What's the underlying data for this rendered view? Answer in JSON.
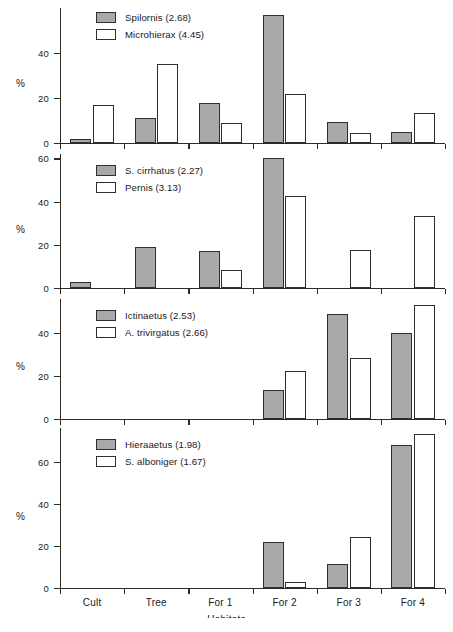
{
  "figure": {
    "xaxis_title": "Habitats",
    "yaxis_label": "%",
    "categories": [
      "Cult",
      "Tree",
      "For 1",
      "For 2",
      "For 3",
      "For 4"
    ],
    "fill_color": "#a9a9a9",
    "open_color": "#ffffff",
    "line_color": "#2e2e2e"
  },
  "chart_data": [
    {
      "type": "bar",
      "panel": 1,
      "title": "",
      "xlabel": "Habitats",
      "ylabel": "%",
      "categories": [
        "Cult",
        "Tree",
        "For 1",
        "For 2",
        "For 3",
        "For 4"
      ],
      "ylim": [
        0,
        60
      ],
      "yticks": [
        0,
        20,
        40
      ],
      "ytick_labels": [
        "0",
        "20",
        "40"
      ],
      "grid": false,
      "legend_position": "top-left",
      "series": [
        {
          "name": "Spilornis (2.68)",
          "style": "filled",
          "values": [
            2,
            11,
            18,
            57,
            9.5,
            5
          ]
        },
        {
          "name": "Microhierax (4.45)",
          "style": "open",
          "values": [
            17,
            35,
            9,
            22,
            4.5,
            13.5
          ]
        }
      ]
    },
    {
      "type": "bar",
      "panel": 2,
      "title": "",
      "xlabel": "Habitats",
      "ylabel": "%",
      "categories": [
        "Cult",
        "Tree",
        "For 1",
        "For 2",
        "For 3",
        "For 4"
      ],
      "ylim": [
        0,
        62
      ],
      "yticks": [
        0,
        20,
        40,
        60
      ],
      "ytick_labels": [
        "0",
        "20",
        "40",
        "60"
      ],
      "grid": false,
      "legend_position": "top-left",
      "series": [
        {
          "name": "S. cirrhatus (2.27)",
          "style": "filled",
          "values": [
            3,
            19,
            17,
            60,
            0,
            0
          ]
        },
        {
          "name": "Pernis (3.13)",
          "style": "open",
          "values": [
            0,
            0,
            8.5,
            42.5,
            17.5,
            33.5
          ]
        }
      ]
    },
    {
      "type": "bar",
      "panel": 3,
      "title": "",
      "xlabel": "Habitats",
      "ylabel": "%",
      "categories": [
        "Cult",
        "Tree",
        "For 1",
        "For 2",
        "For 3",
        "For 4"
      ],
      "ylim": [
        0,
        56
      ],
      "yticks": [
        0,
        20,
        40
      ],
      "ytick_labels": [
        "0",
        "20",
        "40"
      ],
      "grid": false,
      "legend_position": "top-left",
      "series": [
        {
          "name": "Ictinaetus (2.53)",
          "style": "filled",
          "values": [
            0,
            0,
            0,
            13.5,
            49,
            40
          ]
        },
        {
          "name": "A. trivirgatus (2.66)",
          "style": "open",
          "values": [
            0,
            0,
            0,
            22.5,
            28.5,
            53
          ]
        }
      ]
    },
    {
      "type": "bar",
      "panel": 4,
      "title": "",
      "xlabel": "Habitats",
      "ylabel": "%",
      "categories": [
        "Cult",
        "Tree",
        "For 1",
        "For 2",
        "For 3",
        "For 4"
      ],
      "ylim": [
        0,
        76
      ],
      "yticks": [
        0,
        20,
        40,
        60
      ],
      "ytick_labels": [
        "0",
        "20",
        "40",
        "60"
      ],
      "grid": false,
      "legend_position": "top-left",
      "series": [
        {
          "name": "Hieraaetus (1.98)",
          "style": "filled",
          "values": [
            0,
            0,
            0,
            22,
            11.5,
            68
          ]
        },
        {
          "name": "S. alboniger (1.67)",
          "style": "open",
          "values": [
            0,
            0,
            0,
            3,
            24,
            73
          ]
        }
      ]
    }
  ]
}
